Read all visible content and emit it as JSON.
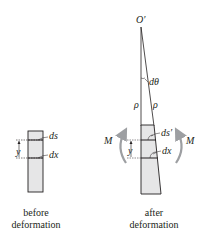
{
  "figure": {
    "before": {
      "caption_line1": "before",
      "caption_line2": "deformation",
      "labels": {
        "ds": "ds",
        "dx": "dx",
        "y": "y"
      }
    },
    "after": {
      "caption_line1": "after",
      "caption_line2": "deformation",
      "labels": {
        "center": "O′",
        "angle": "dθ",
        "rho_left": "ρ",
        "rho_right": "ρ",
        "ds_prime": "ds′",
        "dx": "dx",
        "y": "y",
        "moment_left": "M",
        "moment_right": "M"
      }
    },
    "colors": {
      "element_fill": "#e6e6e7",
      "outline": "#231f20",
      "moment_arrow": "#9d9fa2",
      "text": "#231f20"
    }
  }
}
